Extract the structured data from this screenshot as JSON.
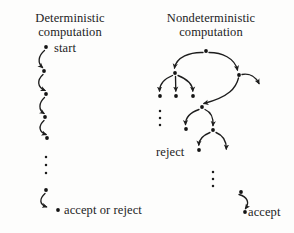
{
  "figure": {
    "width": 294,
    "height": 233,
    "background_color": "#fdfdfc",
    "ink_color": "#1a1a1a"
  },
  "panels": {
    "deterministic": {
      "caption_line1": "Deterministic",
      "caption_line2": "computation",
      "start_label": "start",
      "end_label": "accept or reject",
      "vertical_ellipsis": "⋮"
    },
    "nondeterministic": {
      "caption_line1": "Nondeterministic",
      "caption_line2": "computation",
      "reject_label": "reject",
      "accept_label": "accept",
      "vertical_ellipsis": "⋮"
    }
  },
  "graph_data": {
    "type": "diagram",
    "deterministic": {
      "nodes": [
        {
          "id": "d0",
          "x": 46,
          "y": 47,
          "label": "start"
        },
        {
          "id": "d1",
          "x": 44,
          "y": 71,
          "label": ""
        },
        {
          "id": "d2",
          "x": 46,
          "y": 94,
          "label": ""
        },
        {
          "id": "d3",
          "x": 45,
          "y": 117,
          "label": ""
        },
        {
          "id": "d4",
          "x": 47,
          "y": 138,
          "label": ""
        },
        {
          "id": "d5",
          "x": 46,
          "y": 190,
          "label": ""
        },
        {
          "id": "d6",
          "x": 58,
          "y": 210,
          "label": "accept or reject"
        }
      ],
      "edges": [
        {
          "from": "d0",
          "to": "d1"
        },
        {
          "from": "d1",
          "to": "d2"
        },
        {
          "from": "d2",
          "to": "d3"
        },
        {
          "from": "d3",
          "to": "d4"
        },
        {
          "from": "d5",
          "to": "d6"
        }
      ],
      "ellipsis_between": [
        "d4",
        "d5"
      ]
    },
    "nondeterministic": {
      "nodes": [
        {
          "id": "n0",
          "x": 206,
          "y": 51,
          "label": ""
        },
        {
          "id": "n1",
          "x": 175,
          "y": 73,
          "label": ""
        },
        {
          "id": "n2",
          "x": 239,
          "y": 75,
          "label": ""
        },
        {
          "id": "n3",
          "x": 160,
          "y": 96,
          "label": ""
        },
        {
          "id": "n4",
          "x": 176,
          "y": 96,
          "label": ""
        },
        {
          "id": "n5",
          "x": 193,
          "y": 96,
          "label": ""
        },
        {
          "id": "n6",
          "x": 262,
          "y": 88,
          "label": ""
        },
        {
          "id": "n7",
          "x": 202,
          "y": 107,
          "label": ""
        },
        {
          "id": "n8",
          "x": 186,
          "y": 129,
          "label": ""
        },
        {
          "id": "n9",
          "x": 213,
          "y": 130,
          "label": ""
        },
        {
          "id": "n10",
          "x": 199,
          "y": 150,
          "label": "reject"
        },
        {
          "id": "n11",
          "x": 226,
          "y": 154,
          "label": ""
        },
        {
          "id": "n12",
          "x": 241,
          "y": 192,
          "label": ""
        },
        {
          "id": "n13",
          "x": 245,
          "y": 212,
          "label": "accept"
        }
      ],
      "edges": [
        {
          "from": "n0",
          "to": "n1"
        },
        {
          "from": "n0",
          "to": "n2"
        },
        {
          "from": "n1",
          "to": "n3"
        },
        {
          "from": "n1",
          "to": "n4"
        },
        {
          "from": "n1",
          "to": "n5"
        },
        {
          "from": "n2",
          "to": "n6"
        },
        {
          "from": "n2",
          "to": "n7"
        },
        {
          "from": "n7",
          "to": "n8"
        },
        {
          "from": "n7",
          "to": "n9"
        },
        {
          "from": "n9",
          "to": "n10"
        },
        {
          "from": "n9",
          "to": "n11"
        },
        {
          "from": "n12",
          "to": "n13"
        }
      ],
      "ellipses": [
        {
          "x": 160,
          "y_from": 110,
          "y_to": 126
        },
        {
          "x": 213,
          "y_from": 170,
          "y_to": 188
        }
      ]
    }
  }
}
